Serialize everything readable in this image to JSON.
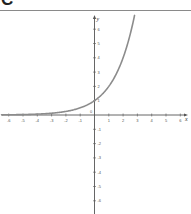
{
  "panel": {
    "label": "C"
  },
  "chart_data": {
    "type": "line",
    "title": "",
    "xlabel": "x",
    "ylabel": "y",
    "xlim": [
      -6.5,
      6.5
    ],
    "ylim": [
      -6.5,
      7
    ],
    "grid": false,
    "x_ticks": [
      -6,
      -5,
      -4,
      -3,
      -2,
      -1,
      1,
      2,
      3,
      4,
      5,
      6
    ],
    "y_ticks": [
      -6,
      -5,
      -4,
      -3,
      -2,
      -1,
      1,
      2,
      3,
      4,
      5,
      6
    ],
    "origin_label": "0",
    "series": [
      {
        "name": "y = 2^x",
        "color": "#8c8c8c",
        "x": [
          -6,
          -5,
          -4,
          -3,
          -2,
          -1,
          0,
          1,
          2,
          2.5,
          2.8
        ],
        "values": [
          0.016,
          0.031,
          0.063,
          0.125,
          0.25,
          0.5,
          1,
          2,
          4,
          5.66,
          6.96
        ]
      }
    ]
  },
  "colors": {
    "axis": "#555555",
    "curve": "#8c8c8c",
    "rule": "#8a8a8a"
  }
}
